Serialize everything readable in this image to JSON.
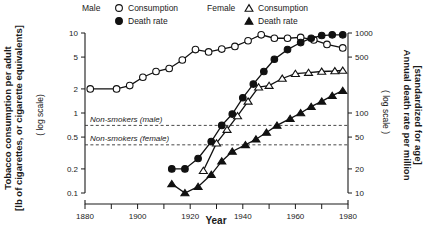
{
  "figure": {
    "x_title": "Year",
    "left_axis": {
      "title_line1": "Tobacco consumption per adult",
      "title_line2": "[lb of cigarettes, or cigarette equivalents]",
      "scale_note": "( log scale)",
      "ticks": [
        "10",
        "5",
        "2",
        "1",
        "0.5",
        "0.2",
        "0.1"
      ]
    },
    "right_axis": {
      "title_line1": "Annual death rate per million",
      "title_line2": "[standardized for age]",
      "scale_note": "( log scale )",
      "ticks": [
        "1000",
        "500",
        "100",
        "50",
        "20",
        "10"
      ]
    },
    "x_ticks": [
      "1880",
      "1900",
      "1920",
      "1940",
      "1960",
      "1980"
    ],
    "legend": {
      "male_group": "Male",
      "female_group": "Female",
      "male_consumption": "Consumption",
      "male_death": "Death rate",
      "female_consumption": "Consumption",
      "female_death": "Death rate"
    },
    "reference_labels": {
      "male": "Non-smokers (male)",
      "female": "Non-smokers (female)"
    },
    "colors": {
      "ink": "#111111",
      "background": "#ffffff",
      "refline": "#333333"
    }
  },
  "chart_data": {
    "type": "line",
    "title": "",
    "xlabel": "Year",
    "ylabel": "Tobacco consumption per adult [lb of cigarettes, or cigarette equivalents] (log scale)",
    "y2label": "Annual death rate per million [standardized for age] (log scale)",
    "xlim": [
      1880,
      1980
    ],
    "ylim": [
      0.1,
      10
    ],
    "y2lim": [
      10,
      1000
    ],
    "yscale": "log",
    "y2scale": "log",
    "grid": false,
    "legend_position": "top",
    "xticks": [
      1880,
      1900,
      1920,
      1940,
      1960,
      1980
    ],
    "xticks_minor": [
      1890,
      1910,
      1930,
      1950,
      1970
    ],
    "yticks": [
      10,
      5,
      2,
      1,
      0.5,
      0.2,
      0.1
    ],
    "y2ticks": [
      1000,
      500,
      100,
      50,
      20,
      10
    ],
    "annotations": [
      {
        "text": "Non-smokers (male)",
        "y2_value": 70,
        "axis": "right",
        "style": "dashed-line"
      },
      {
        "text": "Non-smokers (female)",
        "y2_value": 40,
        "axis": "right",
        "style": "dashed-line"
      }
    ],
    "series": [
      {
        "name": "Male Consumption",
        "axis": "left",
        "marker": "circle-open",
        "units": "lb per adult per year",
        "x": [
          1882,
          1892,
          1897,
          1902,
          1907,
          1912,
          1917,
          1922,
          1927,
          1932,
          1937,
          1942,
          1947,
          1952,
          1957,
          1962,
          1967,
          1972,
          1978
        ],
        "y": [
          2.0,
          2.0,
          2.2,
          2.8,
          3.3,
          3.6,
          4.6,
          6.2,
          5.8,
          6.3,
          6.8,
          8.0,
          9.5,
          8.6,
          8.6,
          8.8,
          8.2,
          7.2,
          6.5
        ]
      },
      {
        "name": "Male Death rate",
        "axis": "right",
        "marker": "circle-filled",
        "units": "deaths per million per year",
        "x": [
          1913,
          1918,
          1923,
          1928,
          1932,
          1936,
          1940,
          1944,
          1948,
          1952,
          1957,
          1962,
          1966,
          1970,
          1974,
          1978
        ],
        "y": [
          20,
          20,
          27,
          44,
          70,
          97,
          155,
          230,
          330,
          470,
          620,
          760,
          860,
          930,
          950,
          950
        ]
      },
      {
        "name": "Female Consumption",
        "axis": "left",
        "marker": "triangle-open",
        "units": "lb per adult per year",
        "x": [
          1925,
          1930,
          1934,
          1938,
          1942,
          1946,
          1950,
          1955,
          1960,
          1965,
          1970,
          1975,
          1978
        ],
        "y": [
          0.19,
          0.42,
          0.62,
          0.92,
          1.4,
          2.1,
          2.2,
          2.7,
          3.1,
          3.2,
          3.3,
          3.35,
          3.4
        ]
      },
      {
        "name": "Female Death rate",
        "axis": "right",
        "marker": "triangle-filled",
        "units": "deaths per million per year",
        "x": [
          1913,
          1918,
          1923,
          1928,
          1932,
          1936,
          1941,
          1945,
          1949,
          1953,
          1958,
          1962,
          1966,
          1970,
          1974,
          1978
        ],
        "y": [
          13,
          10,
          12,
          17,
          25,
          33,
          40,
          47,
          57,
          70,
          85,
          100,
          120,
          140,
          165,
          190
        ]
      }
    ]
  }
}
